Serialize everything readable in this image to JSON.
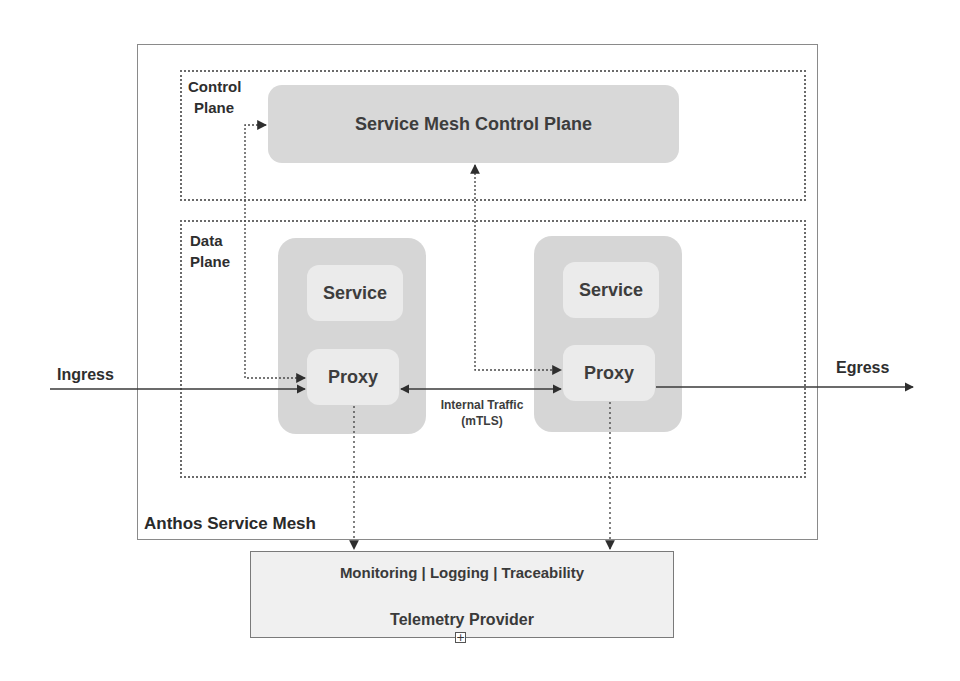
{
  "diagram": {
    "outer_label": "Anthos Service Mesh",
    "control_plane": {
      "label_line1": "Control",
      "label_line2": "Plane",
      "component": "Service Mesh Control Plane"
    },
    "data_plane": {
      "label_line1": "Data",
      "label_line2": "Plane",
      "pods": [
        {
          "service": "Service",
          "proxy": "Proxy"
        },
        {
          "service": "Service",
          "proxy": "Proxy"
        }
      ]
    },
    "ingress": "Ingress",
    "egress": "Egress",
    "internal_traffic_line1": "Internal Traffic",
    "internal_traffic_line2": "(mTLS)",
    "telemetry": {
      "capabilities": "Monitoring | Logging | Traceability",
      "title": "Telemetry Provider",
      "expand_icon": "+"
    },
    "colors": {
      "pod_fill": "#d6d6d6",
      "inner_fill": "#ebebeb",
      "control_pill_fill": "#d8d8d8",
      "telemetry_fill": "#f0f0f0",
      "line": "#3a3a3a"
    }
  }
}
